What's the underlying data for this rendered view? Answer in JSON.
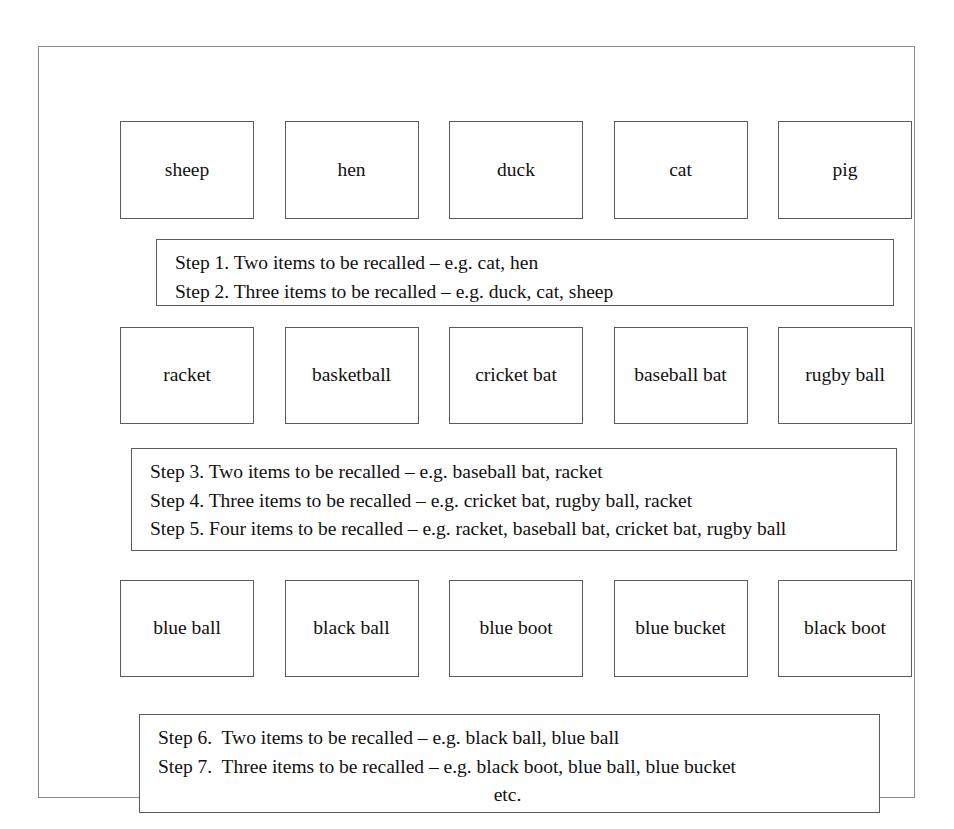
{
  "figure": {
    "rows": [
      {
        "name": "animals",
        "cards": [
          {
            "label": "sheep"
          },
          {
            "label": "hen"
          },
          {
            "label": "duck"
          },
          {
            "label": "cat"
          },
          {
            "label": "pig"
          }
        ]
      },
      {
        "name": "sports",
        "cards": [
          {
            "label": "racket"
          },
          {
            "label": "basketball"
          },
          {
            "label": "cricket bat"
          },
          {
            "label": "baseball bat"
          },
          {
            "label": "rugby ball"
          }
        ]
      },
      {
        "name": "objects",
        "cards": [
          {
            "label": "blue ball"
          },
          {
            "label": "black ball"
          },
          {
            "label": "blue boot"
          },
          {
            "label": "blue bucket"
          },
          {
            "label": "black boot"
          }
        ]
      }
    ],
    "step_boxes": [
      {
        "name": "steps-1-2",
        "lines": [
          "Step 1. Two items to be recalled – e.g. cat, hen",
          "Step 2. Three items to be recalled – e.g. duck, cat, sheep"
        ]
      },
      {
        "name": "steps-3-5",
        "lines": [
          "Step 3. Two items to be recalled – e.g. baseball bat, racket",
          "Step 4. Three items to be recalled – e.g. cricket bat, rugby ball, racket",
          "Step 5. Four items to be recalled – e.g. racket, baseball bat, cricket bat, rugby ball"
        ]
      },
      {
        "name": "steps-6-7",
        "lines": [
          "Step 6.  Two items to be recalled – e.g. black ball, blue ball",
          "Step 7.  Three items to be recalled – e.g. black boot, blue ball, blue bucket",
          "etc."
        ]
      }
    ]
  },
  "colors": {
    "page_background": "#ffffff",
    "frame_border": "#8a8a8a",
    "box_border": "#5b5b5b",
    "text": "#111111"
  }
}
